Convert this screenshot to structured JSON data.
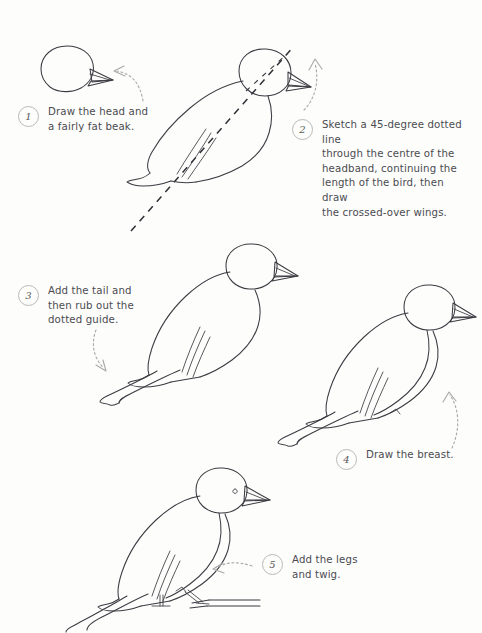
{
  "page": {
    "background_color": "#fdfdfc",
    "ink_color": "#3b3b42",
    "guide_color": "#9a9a9a",
    "text_color": "#4b4b50",
    "width": 482,
    "height": 633
  },
  "steps": [
    {
      "number": "1",
      "text": "Draw the head and\na fairly fat beak.",
      "subject": "head-and-beak-sketch",
      "arrow": "dotted-curved-arrow-left"
    },
    {
      "number": "2",
      "text": "Sketch a 45-degree dotted line\nthrough the centre of the\nheadband, continuing the\nlength of the bird, then draw\nthe crossed-over wings.",
      "subject": "body-with-45-degree-dotted-guide",
      "arrow": "dotted-curved-arrow-up-left"
    },
    {
      "number": "3",
      "text": "Add the tail and\nthen rub out the\ndotted guide.",
      "subject": "bird-with-tail-on-twig",
      "arrow": "dotted-curved-arrow-down-right"
    },
    {
      "number": "4",
      "text": "Draw the breast.",
      "subject": "bird-with-breast-line",
      "arrow": "dotted-curved-arrow-up"
    },
    {
      "number": "5",
      "text": "Add the legs\nand twig.",
      "subject": "finished-bird-with-legs-and-twig",
      "arrow": "dotted-curved-arrow-left"
    }
  ]
}
